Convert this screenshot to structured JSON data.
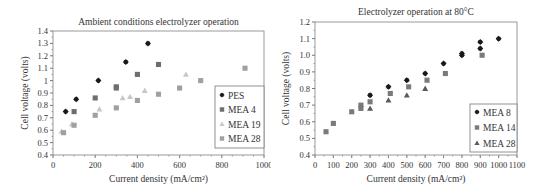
{
  "chart_data": [
    {
      "type": "scatter",
      "title": "Ambient conditions electrolyzer operation",
      "xlabel": "Current density (mA/cm²)",
      "ylabel": "Cell voltage (volts)",
      "xlim": [
        0,
        1000
      ],
      "ylim": [
        0.4,
        1.4
      ],
      "xticks": [
        0,
        200,
        400,
        600,
        800,
        1000
      ],
      "yticks": [
        0.4,
        0.5,
        0.6,
        0.7,
        0.8,
        0.9,
        1,
        1.1,
        1.2,
        1.3,
        1.4
      ],
      "ytick_labels": [
        "0.4",
        "0.5",
        "0.6",
        "0.7",
        "0.8",
        "0.9",
        "1",
        "1.1",
        "1.2",
        "1.3",
        "1.4"
      ],
      "grid": false,
      "legend_position": "right-inside",
      "series": [
        {
          "name": "PES",
          "marker": "diamond",
          "color": "#1a1a1a",
          "x": [
            60,
            110,
            215,
            345,
            450
          ],
          "y": [
            0.75,
            0.85,
            1.0,
            1.15,
            1.3
          ]
        },
        {
          "name": "MEA 4",
          "marker": "square",
          "color": "#6e6e6e",
          "x": [
            100,
            200,
            300,
            300,
            400,
            500
          ],
          "y": [
            0.75,
            0.86,
            0.94,
            0.95,
            1.05,
            1.13
          ]
        },
        {
          "name": "MEA 19",
          "marker": "triangle",
          "color": "#c8c8c8",
          "x": [
            40,
            90,
            220,
            330,
            365,
            435,
            630
          ],
          "y": [
            0.59,
            0.65,
            0.77,
            0.86,
            0.87,
            0.92,
            1.05
          ]
        },
        {
          "name": "MEA 28",
          "marker": "square",
          "color": "#a0a0a0",
          "x": [
            50,
            100,
            200,
            300,
            400,
            500,
            600,
            700,
            910
          ],
          "y": [
            0.58,
            0.64,
            0.72,
            0.78,
            0.84,
            0.89,
            0.94,
            1.0,
            1.1
          ]
        }
      ]
    },
    {
      "type": "scatter",
      "title": "Electrolyzer operation at 80°C",
      "xlabel": "Current density (mA/cm²)",
      "ylabel": "Cell voltage (volts)",
      "xlim": [
        0,
        1100
      ],
      "ylim": [
        0.4,
        1.2
      ],
      "xticks": [
        0,
        100,
        200,
        300,
        400,
        500,
        600,
        700,
        800,
        900,
        1000,
        1100
      ],
      "yticks": [
        0.4,
        0.5,
        0.6,
        0.7,
        0.8,
        0.9,
        1.0,
        1.1,
        1.2
      ],
      "ytick_labels": [
        "0.4",
        "0.5",
        "0.6",
        "0.7",
        "0.8",
        "0.9",
        "1.0",
        "1.1",
        "1.2"
      ],
      "grid": false,
      "legend_position": "lower-right-inside",
      "series": [
        {
          "name": "MEA 8",
          "marker": "diamond",
          "color": "#1a1a1a",
          "x": [
            300,
            400,
            500,
            600,
            700,
            800,
            800,
            900,
            900,
            1000
          ],
          "y": [
            0.76,
            0.81,
            0.85,
            0.89,
            0.95,
            1.0,
            1.01,
            1.04,
            1.08,
            1.1
          ]
        },
        {
          "name": "MEA 14",
          "marker": "square",
          "color": "#7a7a7a",
          "x": [
            60,
            100,
            200,
            250,
            250,
            300,
            410,
            510,
            610,
            710,
            910
          ],
          "y": [
            0.54,
            0.59,
            0.66,
            0.68,
            0.7,
            0.72,
            0.77,
            0.81,
            0.85,
            0.89,
            1.0
          ]
        },
        {
          "name": "MEA 28",
          "marker": "triangle",
          "color": "#5a5a5a",
          "x": [
            300,
            400,
            500,
            600
          ],
          "y": [
            0.68,
            0.73,
            0.76,
            0.8
          ]
        }
      ]
    }
  ]
}
